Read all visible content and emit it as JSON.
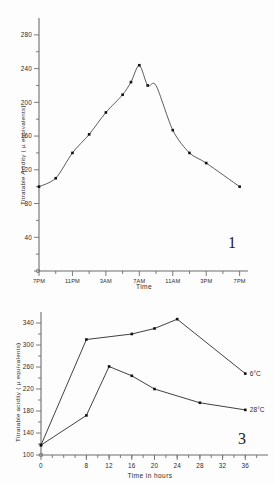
{
  "page": {
    "background_color": "#fdfdfd",
    "ink_color": "#2b2b2b"
  },
  "figure_1": {
    "number_label": "1",
    "y_axis_title": "Titratable Acidity ( µ equivalents)",
    "x_axis_title": "Time"
  },
  "figure_3": {
    "number_label": "3",
    "y_axis_title": "Titratable acidity ( µ equivalents)",
    "x_axis_title": "Time in  hours",
    "series_label_cold": "6°C",
    "series_label_warm": "28°C"
  },
  "chart_data": [
    {
      "id": "figure-1",
      "type": "scatter",
      "title": "",
      "figure_number": "1",
      "xlabel": "Time",
      "ylabel": "Titratable Acidity ( µ equivalents)",
      "x_tick_labels": [
        "7PM",
        "11PM",
        "3AM",
        "7AM",
        "11AM",
        "3PM",
        "7PM"
      ],
      "x_tick_values": [
        0,
        4,
        8,
        12,
        16,
        20,
        24
      ],
      "xlim": [
        0,
        25
      ],
      "y_tick_labels": [
        "0",
        "40",
        "80",
        "120",
        "160",
        "200",
        "240",
        "280"
      ],
      "y_tick_values": [
        0,
        40,
        80,
        120,
        160,
        200,
        240,
        280
      ],
      "ylim": [
        0,
        300
      ],
      "grid": false,
      "legend": "none",
      "fitted_curve": true,
      "series": [
        {
          "name": "Titratable acidity",
          "x": [
            0,
            2,
            4,
            6,
            8,
            10,
            11,
            12,
            13,
            14,
            16,
            18,
            20,
            24
          ],
          "y": [
            100,
            110,
            140,
            162,
            188,
            209,
            224,
            244,
            220,
            220,
            167,
            140,
            128,
            100
          ],
          "marker": "square",
          "points": [
            {
              "x_label": "7PM",
              "x": 0,
              "y": 100
            },
            {
              "x_label": "8PM",
              "x": 2,
              "y": 110
            },
            {
              "x_label": "11PM",
              "x": 4,
              "y": 140
            },
            {
              "x_label": "1AM",
              "x": 6,
              "y": 162
            },
            {
              "x_label": "3AM",
              "x": 8,
              "y": 188
            },
            {
              "x_label": "5AM",
              "x": 10,
              "y": 209
            },
            {
              "x_label": "6AM",
              "x": 11,
              "y": 224
            },
            {
              "x_label": "7AM",
              "x": 12,
              "y": 244
            },
            {
              "x_label": "8AM",
              "x": 13,
              "y": 220
            },
            {
              "x_label": "11AM",
              "x": 16,
              "y": 167
            },
            {
              "x_label": "1PM",
              "x": 18,
              "y": 140
            },
            {
              "x_label": "3PM",
              "x": 20,
              "y": 128
            },
            {
              "x_label": "7PM",
              "x": 24,
              "y": 100
            }
          ]
        }
      ]
    },
    {
      "id": "figure-3",
      "type": "line",
      "title": "",
      "figure_number": "3",
      "xlabel": "Time in  hours",
      "ylabel": "Titratable acidity ( µ equivalents)",
      "x_tick_labels": [
        "0",
        "8",
        "12",
        "16",
        "20",
        "24",
        "28",
        "32",
        "36"
      ],
      "x_tick_values": [
        0,
        8,
        12,
        16,
        20,
        24,
        28,
        32,
        36
      ],
      "xlim": [
        0,
        40
      ],
      "y_tick_labels": [
        "100",
        "140",
        "180",
        "220",
        "260",
        "300",
        "340"
      ],
      "y_tick_values": [
        100,
        140,
        180,
        220,
        260,
        300,
        340
      ],
      "ylim": [
        100,
        360
      ],
      "grid": false,
      "legend": "inline-right",
      "series": [
        {
          "name": "6°C",
          "label": "6°C",
          "marker": "square",
          "x": [
            0,
            8,
            16,
            20,
            24,
            36
          ],
          "y": [
            118,
            310,
            320,
            330,
            347,
            248
          ]
        },
        {
          "name": "28°C",
          "label": "28°C",
          "marker": "square",
          "x": [
            0,
            8,
            12,
            16,
            20,
            28,
            36
          ],
          "y": [
            118,
            172,
            261,
            244,
            220,
            195,
            182
          ]
        }
      ]
    }
  ]
}
